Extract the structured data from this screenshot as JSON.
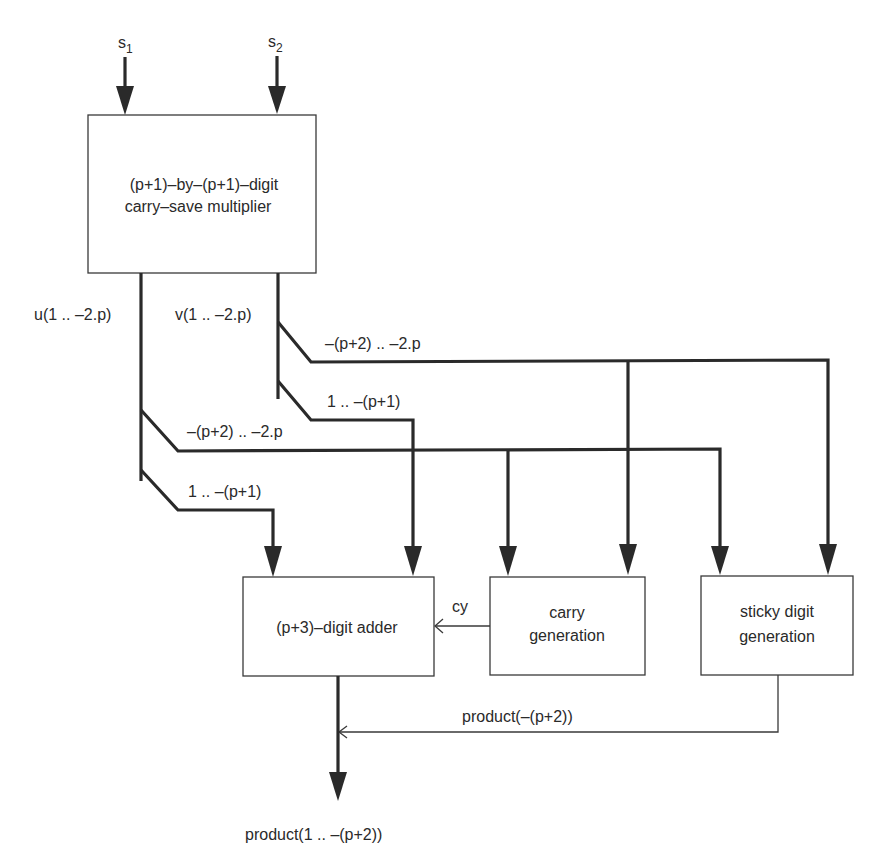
{
  "inputs": {
    "s1": {
      "base": "s",
      "sub": "1"
    },
    "s2": {
      "base": "s",
      "sub": "2"
    }
  },
  "blocks": {
    "multiplier": {
      "line1": "(p+1)–by–(p+1)–digit",
      "line2": "carry–save multiplier"
    },
    "adder": {
      "line1": "(p+3)–digit adder"
    },
    "carry_gen": {
      "line1": "carry",
      "line2": "generation"
    },
    "sticky_gen": {
      "line1": "sticky digit",
      "line2": "generation"
    }
  },
  "signals": {
    "u": "u(1 .. –2.p)",
    "v": "v(1 .. –2.p)",
    "v_low": "–(p+2) .. –2.p",
    "v_high": "1 .. –(p+1)",
    "u_low": "–(p+2) .. –2.p",
    "u_high": "1 .. –(p+1)",
    "cy": "cy",
    "sticky_out": "product(–(p+2))",
    "output": "product(1 .. –(p+2))"
  },
  "colors": {
    "line": "#2a2a2a",
    "box_stroke": "#3a3a3a",
    "background": "#ffffff"
  }
}
